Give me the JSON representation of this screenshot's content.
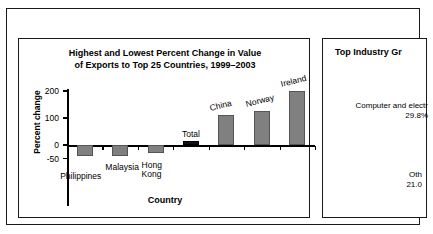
{
  "header": {
    "title": "Exports from Minnesota"
  },
  "left_panel": {
    "title_line1": "Highest and Lowest Percent Change in Value",
    "title_line2": "of Exports to Top 25 Countries, 1999–2003"
  },
  "right_panel": {
    "title": "Top Industry Gr",
    "item1_label": "Computer and electr",
    "item1_value": "29.8%",
    "item2_label": "Oth",
    "item2_value": "21.0"
  },
  "chart_data": {
    "type": "bar",
    "title": "Highest and Lowest Percent Change in Value of Exports to Top 25 Countries, 1999–2003",
    "xlabel": "Country",
    "ylabel": "Percent change",
    "categories": [
      "Philippines",
      "Malaysia",
      "Hong Kong",
      "Total",
      "China",
      "Norway",
      "Ireland"
    ],
    "values": [
      -40,
      -40,
      -30,
      15,
      110,
      125,
      200
    ],
    "ylim": [
      -50,
      200
    ],
    "yticks": [
      200,
      100,
      0,
      -50
    ],
    "ytick_labels": [
      "200",
      "100",
      "0",
      "-50"
    ],
    "grid": false,
    "legend": "none",
    "bar_colors": [
      "#808080",
      "#808080",
      "#808080",
      "#111111",
      "#808080",
      "#808080",
      "#808080"
    ],
    "highlight_category": "Total"
  }
}
